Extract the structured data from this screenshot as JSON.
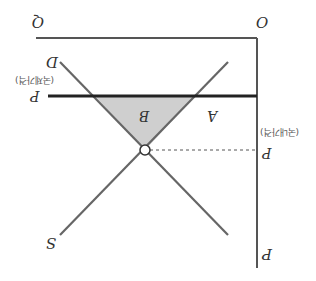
{
  "diagram": {
    "orientation": "rotated 180 degrees",
    "type": "supply-demand with world price",
    "axes": {
      "origin_label": "O",
      "x_axis_label": "Q",
      "y_axis_label": "P"
    },
    "curves": {
      "supply_label": "S",
      "demand_label": "D"
    },
    "prices": {
      "world_price_label": "P",
      "world_price_subscript": "W",
      "world_price_note": "(국제가격)",
      "domestic_price_label": "P",
      "domestic_price_subscript": "D",
      "domestic_price_note": "(국내가격)"
    },
    "regions": {
      "region_a": "A",
      "region_b": "B"
    },
    "colors": {
      "axis": "#555555",
      "curves": "#666666",
      "world_price_line": "#222222",
      "shade": "#cfcfcf"
    }
  }
}
